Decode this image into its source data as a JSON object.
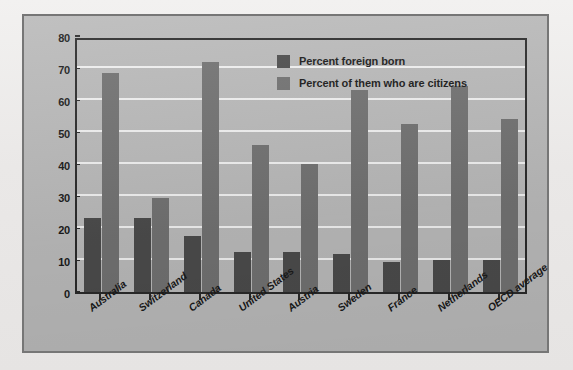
{
  "chart_data": {
    "type": "bar",
    "title": "",
    "subtitle": "",
    "xlabel": "",
    "ylabel": "",
    "ylim": [
      0,
      80
    ],
    "ytick_step": 10,
    "yticks": [
      "0",
      "10",
      "20",
      "30",
      "40",
      "50",
      "60",
      "70",
      "80"
    ],
    "grid": true,
    "grid_axis": "y",
    "legend_position": "top-right",
    "categories": [
      "Australia",
      "Switzerland",
      "Canada",
      "United States",
      "Austria",
      "Sweden",
      "France",
      "Netherlands",
      "OECD average"
    ],
    "series": [
      {
        "name": "Percent foreign born",
        "color": "#4b4b4b",
        "values": [
          23,
          23,
          17.5,
          12.5,
          12.5,
          12,
          9.5,
          10,
          10
        ]
      },
      {
        "name": "Percent of them who are citizens",
        "color": "#717171",
        "values": [
          68.5,
          29.5,
          72,
          46,
          40,
          63,
          52.5,
          64.5,
          54
        ]
      }
    ]
  },
  "legend": {
    "items": [
      {
        "label": "Percent foreign born",
        "swatch": "legend-swatch-dark"
      },
      {
        "label": "Percent of them who are citizens",
        "swatch": "legend-swatch-light"
      }
    ]
  },
  "colors": {
    "series_dark": "#4b4b4b",
    "series_light": "#717171",
    "plot_background": "#b9b9b9",
    "gridline": "#f0f0f0",
    "axis": "#2a2a2a",
    "frame_border": "#767676",
    "page_background": "#eceaea"
  }
}
